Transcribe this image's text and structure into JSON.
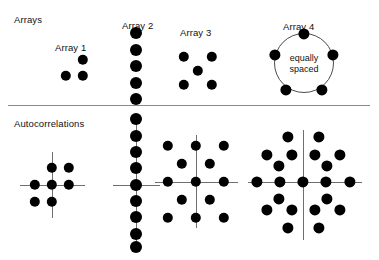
{
  "figure": {
    "width": 379,
    "height": 260,
    "background": "#ffffff",
    "dot_color": "#000000",
    "axis_color": "#6f6f6f",
    "divider_color": "#8a8a8a",
    "text_color": "#111111"
  },
  "sections": {
    "top_label": "Arrays",
    "bottom_label": "Autocorrelations"
  },
  "divider": {
    "x1": 8,
    "x2": 370,
    "y": 105
  },
  "arrays": [
    {
      "id": "array-1",
      "label": "Array 1",
      "label_x": 55,
      "label_y": 42,
      "dot_radius": 5.2,
      "points": [
        {
          "x": 83,
          "y": 60
        },
        {
          "x": 66,
          "y": 76
        },
        {
          "x": 83,
          "y": 76
        }
      ]
    },
    {
      "id": "array-2",
      "label": "Array 2",
      "label_x": 122,
      "label_y": 20,
      "dot_radius": 6.0,
      "points": [
        {
          "x": 136,
          "y": 33
        },
        {
          "x": 136,
          "y": 50
        },
        {
          "x": 136,
          "y": 66
        },
        {
          "x": 136,
          "y": 83
        },
        {
          "x": 136,
          "y": 99
        }
      ]
    },
    {
      "id": "array-3",
      "label": "Array 3",
      "label_x": 180,
      "label_y": 27,
      "dot_radius": 5.2,
      "points": [
        {
          "x": 184,
          "y": 57
        },
        {
          "x": 212,
          "y": 57
        },
        {
          "x": 198,
          "y": 71
        },
        {
          "x": 184,
          "y": 85
        },
        {
          "x": 212,
          "y": 85
        }
      ]
    },
    {
      "id": "array-4",
      "label": "Array 4",
      "label_x": 283,
      "label_y": 21,
      "dot_radius": 5.6,
      "circle": {
        "cx": 304,
        "cy": 63,
        "r": 30
      },
      "annotation": "equally\nspaced",
      "annotation_line1": "equally",
      "annotation_line2": "spaced",
      "points": [
        {
          "x": 304,
          "y": 34
        },
        {
          "x": 275,
          "y": 55
        },
        {
          "x": 333,
          "y": 55
        },
        {
          "x": 286,
          "y": 90
        },
        {
          "x": 322,
          "y": 90
        }
      ]
    }
  ],
  "autocorrelations": [
    {
      "id": "autocorr-1",
      "of": "Array 1",
      "dot_radius": 5.2,
      "center": {
        "x": 52,
        "y": 185
      },
      "axis_h": {
        "x1": 20,
        "x2": 85,
        "y": 185
      },
      "axis_v": {
        "y1": 152,
        "y2": 218,
        "x": 52
      },
      "points": [
        {
          "x": 52,
          "y": 185
        },
        {
          "x": 52,
          "y": 168
        },
        {
          "x": 52,
          "y": 202
        },
        {
          "x": 35,
          "y": 185
        },
        {
          "x": 69,
          "y": 185
        },
        {
          "x": 69,
          "y": 168
        },
        {
          "x": 35,
          "y": 202
        }
      ]
    },
    {
      "id": "autocorr-2",
      "of": "Array 2",
      "dot_radius": 6.0,
      "center": {
        "x": 136,
        "y": 185
      },
      "axis_h": {
        "x1": 113,
        "x2": 160,
        "y": 185
      },
      "axis_v": {
        "y1": 115,
        "y2": 250,
        "x": 136
      },
      "points": [
        {
          "x": 136,
          "y": 119
        },
        {
          "x": 136,
          "y": 136
        },
        {
          "x": 136,
          "y": 152
        },
        {
          "x": 136,
          "y": 168
        },
        {
          "x": 136,
          "y": 185
        },
        {
          "x": 136,
          "y": 201
        },
        {
          "x": 136,
          "y": 217
        },
        {
          "x": 136,
          "y": 234
        },
        {
          "x": 136,
          "y": 247
        }
      ]
    },
    {
      "id": "autocorr-3",
      "of": "Array 3",
      "dot_radius": 5.2,
      "center": {
        "x": 196,
        "y": 182
      },
      "axis_h": {
        "x1": 155,
        "x2": 238,
        "y": 182
      },
      "axis_v": {
        "y1": 135,
        "y2": 228,
        "x": 196
      },
      "points": [
        {
          "x": 196,
          "y": 182
        },
        {
          "x": 168,
          "y": 146
        },
        {
          "x": 196,
          "y": 146
        },
        {
          "x": 224,
          "y": 146
        },
        {
          "x": 182,
          "y": 164
        },
        {
          "x": 210,
          "y": 164
        },
        {
          "x": 168,
          "y": 182
        },
        {
          "x": 224,
          "y": 182
        },
        {
          "x": 182,
          "y": 200
        },
        {
          "x": 210,
          "y": 200
        },
        {
          "x": 168,
          "y": 218
        },
        {
          "x": 196,
          "y": 218
        },
        {
          "x": 224,
          "y": 218
        }
      ]
    },
    {
      "id": "autocorr-4",
      "of": "Array 4",
      "dot_radius": 5.6,
      "center": {
        "x": 303,
        "y": 182
      },
      "axis_h": {
        "x1": 248,
        "x2": 362,
        "y": 182
      },
      "axis_v": {
        "y1": 130,
        "y2": 240,
        "x": 303
      },
      "points": [
        {
          "x": 303,
          "y": 182
        },
        {
          "x": 288,
          "y": 137
        },
        {
          "x": 319,
          "y": 137
        },
        {
          "x": 267,
          "y": 155
        },
        {
          "x": 292,
          "y": 155
        },
        {
          "x": 315,
          "y": 155
        },
        {
          "x": 340,
          "y": 155
        },
        {
          "x": 279,
          "y": 166
        },
        {
          "x": 327,
          "y": 166
        },
        {
          "x": 257,
          "y": 182
        },
        {
          "x": 280,
          "y": 182
        },
        {
          "x": 326,
          "y": 182
        },
        {
          "x": 350,
          "y": 182
        },
        {
          "x": 279,
          "y": 199
        },
        {
          "x": 327,
          "y": 199
        },
        {
          "x": 267,
          "y": 210
        },
        {
          "x": 292,
          "y": 210
        },
        {
          "x": 315,
          "y": 210
        },
        {
          "x": 340,
          "y": 210
        },
        {
          "x": 288,
          "y": 228
        },
        {
          "x": 319,
          "y": 228
        }
      ]
    }
  ]
}
